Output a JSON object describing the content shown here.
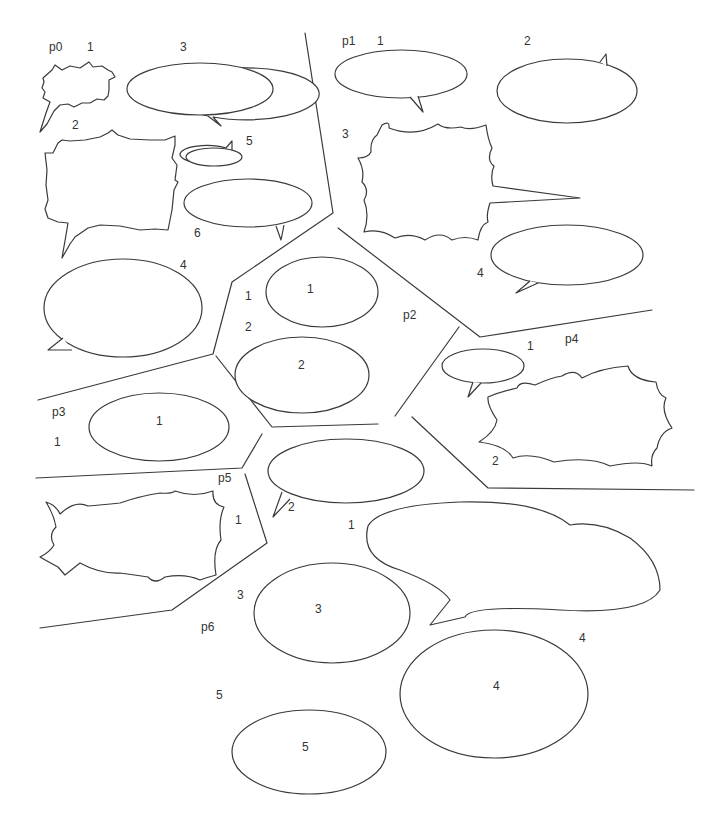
{
  "colors": {
    "line": "#3a3a3a",
    "text": "#333333",
    "background": "#ffffff"
  },
  "panels": [
    {
      "id": "p0",
      "label": "p0",
      "bubbles": [
        {
          "order": "1",
          "shape": "spiky"
        },
        {
          "order": "2",
          "shape": "spiky"
        },
        {
          "order": "3",
          "shape": "ellipse"
        },
        {
          "order": "4",
          "shape": "ellipse"
        },
        {
          "order": "5",
          "shape": "ellipse"
        },
        {
          "order": "6",
          "shape": "ellipse"
        }
      ]
    },
    {
      "id": "p1",
      "label": "p1",
      "bubbles": [
        {
          "order": "1",
          "shape": "ellipse"
        },
        {
          "order": "2",
          "shape": "ellipse"
        },
        {
          "order": "3",
          "shape": "scalloped"
        },
        {
          "order": "4",
          "shape": "ellipse"
        }
      ]
    },
    {
      "id": "p2",
      "label": "p2",
      "bubbles": [
        {
          "order": "1",
          "shape": "ellipse",
          "inner": "1"
        },
        {
          "order": "2",
          "shape": "ellipse",
          "inner": "2"
        }
      ]
    },
    {
      "id": "p3",
      "label": "p3",
      "bubbles": [
        {
          "order": "1",
          "shape": "ellipse",
          "inner": "1"
        }
      ]
    },
    {
      "id": "p4",
      "label": "p4",
      "bubbles": [
        {
          "order": "1",
          "shape": "ellipse"
        },
        {
          "order": "2",
          "shape": "spiky"
        }
      ]
    },
    {
      "id": "p5",
      "label": "p5",
      "bubbles": [
        {
          "order": "1",
          "shape": "scalloped"
        },
        {
          "order": "2",
          "shape": "ellipse"
        }
      ]
    },
    {
      "id": "p6",
      "label": "p6",
      "bubbles": [
        {
          "order": "1",
          "shape": "double-ellipse"
        },
        {
          "order": "3",
          "shape": "ellipse",
          "inner": "3"
        },
        {
          "order": "4",
          "shape": "ellipse",
          "inner": "4"
        },
        {
          "order": "5",
          "shape": "ellipse",
          "inner": "5"
        }
      ]
    }
  ]
}
